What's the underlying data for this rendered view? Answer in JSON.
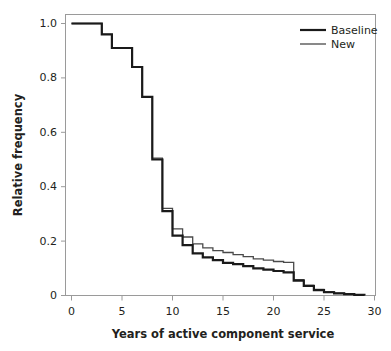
{
  "chart_data": {
    "type": "line",
    "title": "",
    "xlabel": "Years of active component service",
    "ylabel": "Relative frequency",
    "xlim": [
      0,
      30
    ],
    "ylim": [
      0,
      1.0
    ],
    "xticks": [
      0,
      5,
      10,
      15,
      20,
      25,
      30
    ],
    "xtick_labels": [
      "0",
      "5",
      "10",
      "15",
      "20",
      "25",
      "30"
    ],
    "yticks": [
      0,
      0.2,
      0.4,
      0.6,
      0.8,
      1.0
    ],
    "ytick_labels": [
      "0",
      "0.2",
      "0.4",
      "0.6",
      "0.8",
      "1.0"
    ],
    "grid": false,
    "legend_position": "top-right",
    "step_type": "post",
    "series": [
      {
        "name": "Baseline",
        "color": "#1a1a1a",
        "line_width": 2.2,
        "x": [
          0,
          1,
          2,
          3,
          4,
          5,
          6,
          7,
          8,
          9,
          10,
          11,
          12,
          13,
          14,
          15,
          16,
          17,
          18,
          19,
          20,
          21,
          22,
          23,
          24,
          25,
          26,
          27,
          28,
          29
        ],
        "values": [
          1.0,
          1.0,
          1.0,
          0.96,
          0.91,
          0.91,
          0.84,
          0.73,
          0.5,
          0.31,
          0.22,
          0.185,
          0.155,
          0.14,
          0.13,
          0.12,
          0.115,
          0.108,
          0.1,
          0.095,
          0.09,
          0.085,
          0.055,
          0.035,
          0.02,
          0.012,
          0.008,
          0.005,
          0.002,
          0.0
        ]
      },
      {
        "name": "New",
        "color": "#4a4a4a",
        "line_width": 1.3,
        "x": [
          0,
          1,
          2,
          3,
          4,
          5,
          6,
          7,
          8,
          9,
          10,
          11,
          12,
          13,
          14,
          15,
          16,
          17,
          18,
          19,
          20,
          21,
          22,
          23,
          24,
          25,
          26,
          27,
          28,
          29
        ],
        "values": [
          1.0,
          1.0,
          1.0,
          0.96,
          0.91,
          0.91,
          0.84,
          0.73,
          0.505,
          0.32,
          0.245,
          0.215,
          0.19,
          0.175,
          0.165,
          0.158,
          0.15,
          0.143,
          0.135,
          0.13,
          0.125,
          0.122,
          0.058,
          0.038,
          0.022,
          0.014,
          0.009,
          0.005,
          0.002,
          0.0
        ]
      }
    ]
  },
  "legend": {
    "entries": [
      {
        "label": "Baseline"
      },
      {
        "label": "New"
      }
    ]
  }
}
